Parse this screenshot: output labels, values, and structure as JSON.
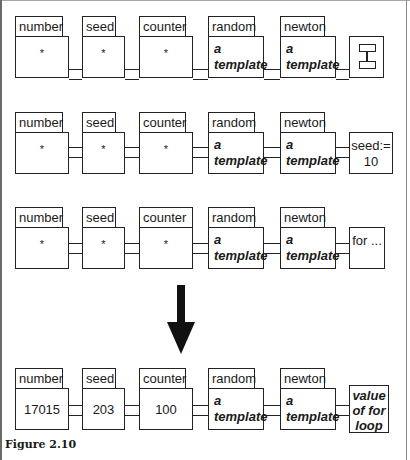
{
  "figure": {
    "caption": "Figure 2.10",
    "rows": [
      {
        "cells": [
          {
            "label": "number",
            "value": "*"
          },
          {
            "label": "seed",
            "value": "*"
          },
          {
            "label": "counter",
            "value": "*"
          },
          {
            "label": "random",
            "value_line1": "a",
            "value_line2": "template"
          },
          {
            "label": "newton",
            "value_line1": "a",
            "value_line2": "template"
          }
        ],
        "end": {
          "type": "icon",
          "icon": "stack-frame-icon"
        }
      },
      {
        "cells": [
          {
            "label": "number",
            "value": "*"
          },
          {
            "label": "seed",
            "value": "*"
          },
          {
            "label": "counter",
            "value": "*"
          },
          {
            "label": "random",
            "value_line1": "a",
            "value_line2": "template"
          },
          {
            "label": "newton",
            "value_line1": "a",
            "value_line2": "template"
          }
        ],
        "end": {
          "type": "text",
          "line1": "seed:=",
          "line2": "10"
        }
      },
      {
        "cells": [
          {
            "label": "number",
            "value": "*"
          },
          {
            "label": "seed",
            "value": "*"
          },
          {
            "label": "counter",
            "value": "*"
          },
          {
            "label": "random",
            "value_line1": "a",
            "value_line2": "template"
          },
          {
            "label": "newton",
            "value_line1": "a",
            "value_line2": "template"
          }
        ],
        "end": {
          "type": "text",
          "line1": "for ..."
        }
      },
      {
        "cells": [
          {
            "label": "number",
            "value": "17015"
          },
          {
            "label": "seed",
            "value": "203"
          },
          {
            "label": "counter",
            "value": "100"
          },
          {
            "label": "random",
            "value_line1": "a",
            "value_line2": "template"
          },
          {
            "label": "newton",
            "value_line1": "a",
            "value_line2": "template"
          }
        ],
        "end": {
          "type": "text",
          "line1": "value",
          "line2": "of for",
          "line3": "loop"
        }
      }
    ]
  }
}
